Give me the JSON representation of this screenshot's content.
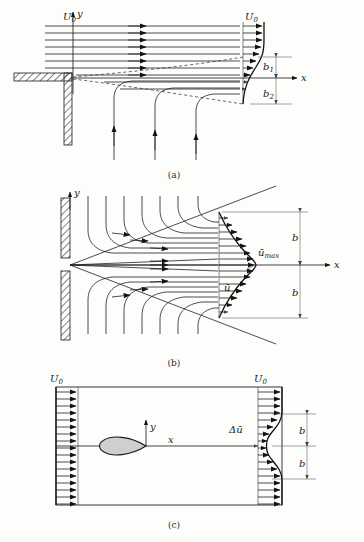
{
  "figure": {
    "background_color": "#fdfdfb",
    "ink_color": "#1a1a1a",
    "body_fill_color": "#cfcfcf",
    "width": 364,
    "height": 542
  },
  "panels": [
    {
      "id": "a",
      "caption": "(a)",
      "name": "mixing-layer-panel",
      "description": "Plane mixing layer downstream of a splitter plate edge",
      "axes": {
        "x_label": "x",
        "y_label": "y"
      },
      "labels": {
        "inlet_velocity": "U_0",
        "outlet_velocity": "U_0",
        "upper_width": "b_1",
        "lower_width": "b_2"
      },
      "inlet_streamline_count": 8,
      "outlet_arrow_count": 8,
      "entrainment_arrow_count": 3
    },
    {
      "id": "b",
      "caption": "(b)",
      "name": "free-jet-panel",
      "description": "Plane free jet issuing from a slot in a wall, with entrainment streamlines",
      "axes": {
        "x_label": "x",
        "y_label": "y"
      },
      "labels": {
        "max_velocity": "ū_max",
        "mean_velocity": "ū",
        "half_width_upper": "b",
        "half_width_lower": "b"
      },
      "streamline_count": 14,
      "profile_arrow_count": 17
    },
    {
      "id": "c",
      "caption": "(c)",
      "name": "wake-panel",
      "description": "Wake behind a streamlined body in uniform flow",
      "axes": {
        "x_label": "x",
        "y_label": "y"
      },
      "labels": {
        "inlet_velocity": "U_0",
        "outlet_velocity": "U_0",
        "velocity_defect": "Δū",
        "half_width_upper": "b",
        "half_width_lower": "b"
      },
      "inlet_arrow_count": 17,
      "outlet_arrow_count": 17
    }
  ],
  "glyphs": {
    "u_bar": "ū",
    "delta": "Δ",
    "subscript_zero": "0",
    "subscript_one": "1",
    "subscript_two": "2",
    "subscript_max": "max"
  }
}
